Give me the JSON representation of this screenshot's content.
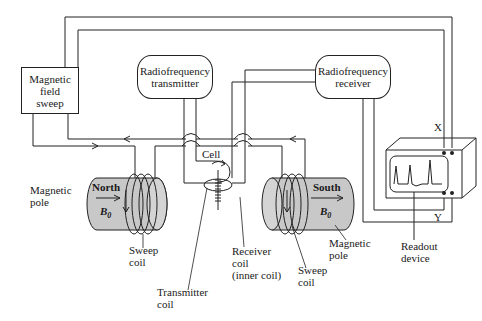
{
  "diagram": {
    "boxes": {
      "sweep": [
        "Magnetic",
        "field",
        "sweep"
      ],
      "transmitter": [
        "Radiofrequency",
        "transmitter"
      ],
      "receiver": [
        "Radiofrequency",
        "receiver"
      ]
    },
    "magnets": {
      "north": {
        "name": "North",
        "field": "B",
        "field_sub": "0"
      },
      "south": {
        "name": "South",
        "field": "B",
        "field_sub": "0"
      }
    },
    "labels": {
      "cell": "Cell",
      "magnetic_pole_left": [
        "Magnetic",
        "pole"
      ],
      "sweep_coil_left": [
        "Sweep",
        "coil"
      ],
      "transmitter_coil": [
        "Transmitter",
        "coil"
      ],
      "receiver_coil": [
        "Receiver",
        "coil",
        "(inner coil)"
      ],
      "sweep_coil_right": [
        "Sweep",
        "coil"
      ],
      "magnetic_pole_right": [
        "Magnetic",
        "pole"
      ],
      "readout_device": [
        "Readout",
        "device"
      ],
      "x_terminal": "X",
      "y_terminal": "Y"
    },
    "colors": {
      "magnet_fill": "#c8c8c8",
      "line": "#222222",
      "background": "#ffffff"
    }
  }
}
